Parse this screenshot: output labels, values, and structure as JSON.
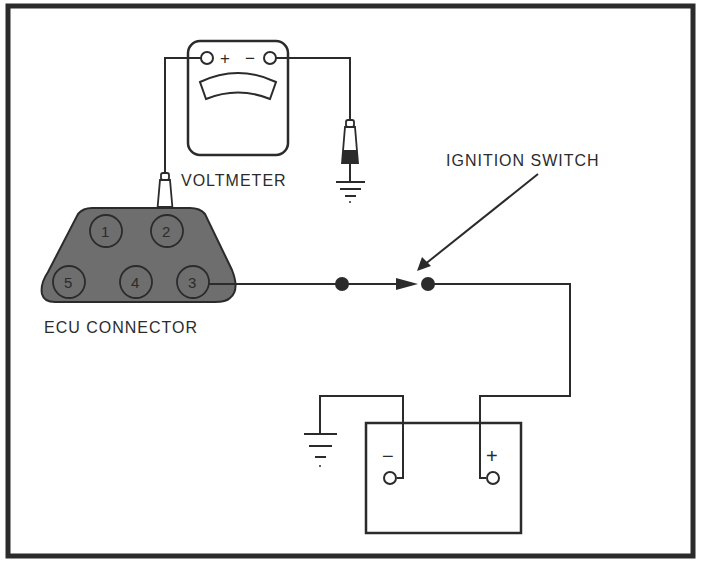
{
  "diagram": {
    "colors": {
      "line": "#2b2b2b",
      "connector_fill": "#6e6e6e",
      "background": "#ffffff"
    },
    "labels": {
      "voltmeter": "VOLTMETER",
      "ecu_connector": "ECU CONNECTOR",
      "ignition_switch": "IGNITION SWITCH"
    },
    "voltmeter": {
      "plus_symbol": "+",
      "minus_symbol": "−"
    },
    "ecu_connector": {
      "pins": [
        "1",
        "2",
        "3",
        "4",
        "5"
      ]
    },
    "battery": {
      "negative_symbol": "−",
      "positive_symbol": "+"
    }
  }
}
